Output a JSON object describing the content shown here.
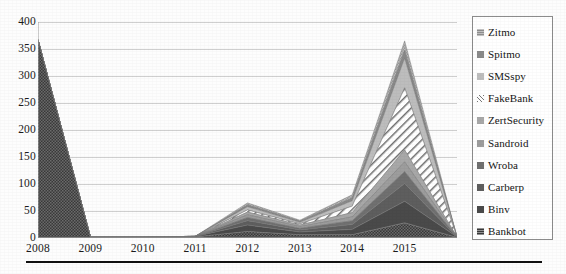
{
  "chart_data": {
    "type": "area",
    "stacked": true,
    "title": "",
    "subtitle": "",
    "xlabel": "",
    "ylabel": "",
    "grid": true,
    "legend_position": "right",
    "ylim": [
      0,
      400
    ],
    "ytick_step": 50,
    "ytick_labels": [
      "400",
      "350",
      "300",
      "250",
      "200",
      "150",
      "100",
      "50",
      "0"
    ],
    "ytick_values": [
      400,
      350,
      300,
      250,
      200,
      150,
      100,
      50,
      0
    ],
    "x": [
      2008,
      2009,
      2010,
      2011,
      2012,
      2013,
      2014,
      2015,
      2016
    ],
    "xtick_labels": [
      "2008",
      "2009",
      "2010",
      "2011",
      "2012",
      "2013",
      "2014",
      "2015"
    ],
    "xtick_values": [
      2008,
      2009,
      2010,
      2011,
      2012,
      2013,
      2014,
      2015
    ],
    "totals": [
      367,
      2,
      2,
      3,
      65,
      33,
      80,
      365,
      2
    ],
    "series": [
      {
        "name": "Zitmo",
        "fill": "#8e8e8e",
        "pattern": "checker",
        "values": [
          0,
          0,
          0,
          0,
          4,
          2,
          6,
          18,
          0
        ]
      },
      {
        "name": "Spitmo",
        "fill": "#8a8a8a",
        "pattern": "solid",
        "values": [
          0,
          0,
          0,
          0,
          3,
          2,
          5,
          14,
          0
        ]
      },
      {
        "name": "SMSspy",
        "fill": "#bdbdbd",
        "pattern": "solid",
        "values": [
          0,
          0,
          0,
          0,
          6,
          3,
          10,
          55,
          0
        ]
      },
      {
        "name": "FakeBank",
        "fill": "#ffffff",
        "pattern": "diagonal",
        "values": [
          0,
          0,
          0,
          0,
          4,
          2,
          12,
          115,
          0
        ]
      },
      {
        "name": "ZertSecurity",
        "fill": "#a8a8a8",
        "pattern": "solid",
        "values": [
          0,
          0,
          0,
          0,
          5,
          3,
          8,
          22,
          0
        ]
      },
      {
        "name": "Sandroid",
        "fill": "#9d9d9d",
        "pattern": "solid",
        "values": [
          0,
          0,
          0,
          0,
          5,
          3,
          7,
          18,
          0
        ]
      },
      {
        "name": "Wroba",
        "fill": "#707070",
        "pattern": "solid",
        "values": [
          0,
          0,
          0,
          0,
          6,
          3,
          7,
          22,
          0
        ]
      },
      {
        "name": "Carberp",
        "fill": "#5e5e5e",
        "pattern": "solid",
        "values": [
          0,
          0,
          0,
          0,
          8,
          4,
          9,
          33,
          0
        ]
      },
      {
        "name": "Binv",
        "fill": "#4a4a4a",
        "pattern": "solid",
        "values": [
          0,
          0,
          0,
          1,
          12,
          5,
          10,
          40,
          1
        ]
      },
      {
        "name": "Bankbot",
        "fill": "#3a3a3a",
        "pattern": "checker",
        "values": [
          367,
          2,
          2,
          2,
          12,
          6,
          6,
          28,
          1
        ]
      }
    ]
  },
  "legend": {
    "items": [
      {
        "label": "Zitmo"
      },
      {
        "label": "Spitmo"
      },
      {
        "label": "SMSspy"
      },
      {
        "label": "FakeBank"
      },
      {
        "label": "ZertSecurity"
      },
      {
        "label": "Sandroid"
      },
      {
        "label": "Wroba"
      },
      {
        "label": "Carberp"
      },
      {
        "label": "Binv"
      },
      {
        "label": "Bankbot"
      }
    ]
  },
  "colors": {
    "background": "#fdfdfd",
    "grid": "#c9c9c9",
    "axis": "#9a9a9a",
    "text": "#1a1a1a",
    "legend_border": "#8c8c8c",
    "rule": "#111111"
  }
}
